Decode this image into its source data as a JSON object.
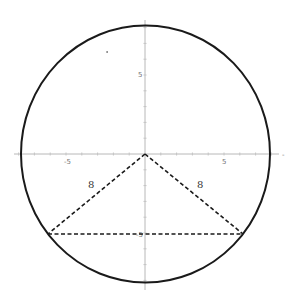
{
  "diagram": {
    "type": "geometry",
    "origin_px": [
      145,
      154
    ],
    "unit_px": 15.8,
    "axes": {
      "x_tick_labels": [
        "-5",
        "5"
      ],
      "y_tick_labels": [
        "5",
        "-5"
      ],
      "x_range": [
        -8.5,
        8.5
      ],
      "y_range": [
        -8.5,
        8.5
      ],
      "tick_step": 1
    },
    "circle": {
      "center": [
        0,
        0
      ],
      "radius": 8,
      "color": "#1a1a1a"
    },
    "triangle": {
      "vertices": [
        [
          0,
          0
        ],
        [
          -6.2,
          -5.05
        ],
        [
          6.2,
          -5.05
        ]
      ],
      "style": "dashed",
      "side_labels": [
        "8",
        "8"
      ]
    },
    "colors": {
      "axis": "#b8b8b8",
      "stroke": "#1a1a1a",
      "label": "#777777"
    }
  }
}
